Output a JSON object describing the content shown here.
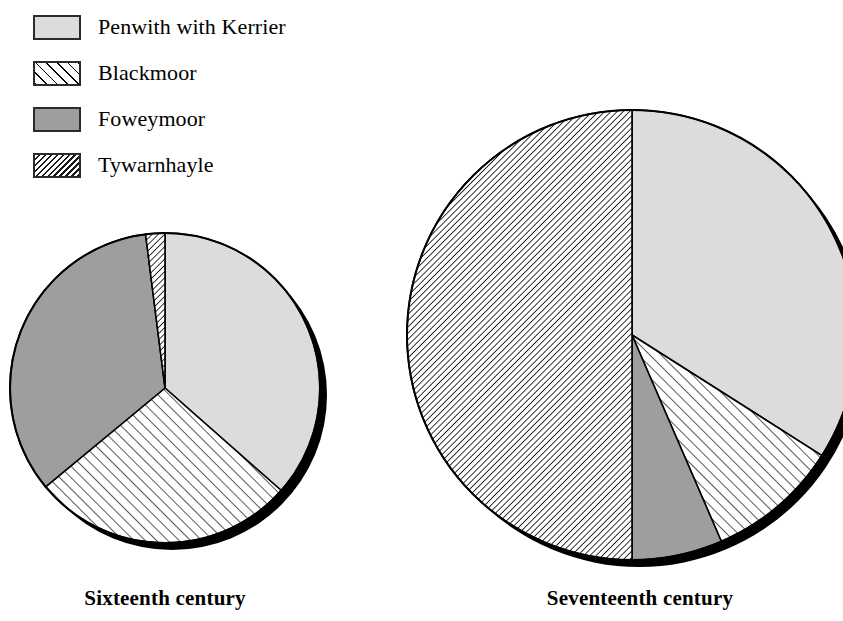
{
  "legend": {
    "items": [
      {
        "label": "Penwith with Kerrier",
        "pattern": "solid-light",
        "color": "#dcdcdc"
      },
      {
        "label": "Blackmoor",
        "pattern": "hatch-sparse",
        "color": "#ffffff"
      },
      {
        "label": "Foweymoor",
        "pattern": "solid-gray",
        "color": "#9e9e9e"
      },
      {
        "label": "Tywarnhayle",
        "pattern": "hatch-dense",
        "color": "#ffffff"
      }
    ]
  },
  "charts": [
    {
      "caption": "Sixteenth century"
    },
    {
      "caption": "Seventeenth century"
    }
  ],
  "chart_data": [
    {
      "type": "pie",
      "title": "Sixteenth century",
      "categories": [
        "Penwith with Kerrier",
        "Blackmoor",
        "Foweymoor",
        "Tywarnhayle"
      ],
      "values": [
        36.5,
        27.5,
        34.0,
        2.0
      ],
      "units": "percent",
      "start_angle_deg": 0,
      "direction": "clockwise",
      "radius_px": 155,
      "center_px": [
        165,
        388
      ],
      "patterns": [
        "solid-light",
        "hatch-sparse",
        "solid-gray",
        "hatch-dense"
      ],
      "legend_position": "top-left",
      "grid": false
    },
    {
      "type": "pie",
      "title": "Seventeenth century",
      "categories": [
        "Penwith with Kerrier",
        "Blackmoor",
        "Foweymoor",
        "Tywarnhayle"
      ],
      "values": [
        34.0,
        9.5,
        6.5,
        50.0
      ],
      "units": "percent",
      "start_angle_deg": 0,
      "direction": "clockwise",
      "radius_px": 225,
      "center_px": [
        632,
        335
      ],
      "patterns": [
        "solid-light",
        "hatch-sparse",
        "solid-gray",
        "hatch-dense"
      ],
      "legend_position": "top-left",
      "grid": false
    }
  ]
}
